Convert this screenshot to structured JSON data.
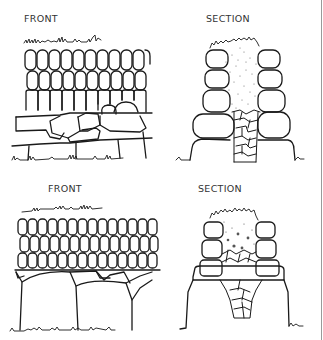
{
  "diagram": {
    "stroke_color": "#1a1a1a",
    "edge_line_color": "#9a9a9a",
    "panels": [
      {
        "id": "top-front",
        "label": "FRONT",
        "label_pos": [
          24,
          14
        ]
      },
      {
        "id": "top-section",
        "label": "SECTION",
        "label_pos": [
          206,
          14
        ]
      },
      {
        "id": "bottom-front",
        "label": "FRONT",
        "label_pos": [
          48,
          184
        ]
      },
      {
        "id": "bottom-section",
        "label": "SECTION",
        "label_pos": [
          198,
          184
        ]
      }
    ]
  }
}
